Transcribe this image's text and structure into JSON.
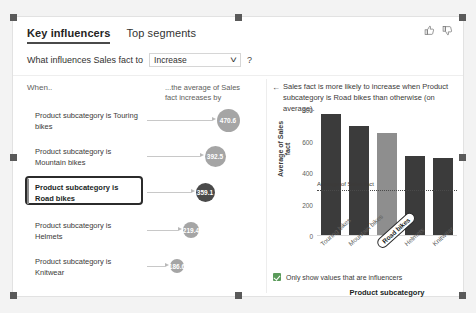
{
  "visual": {
    "tabs": [
      {
        "label": "Key influencers",
        "active": true
      },
      {
        "label": "Top segments",
        "active": false
      }
    ],
    "question": {
      "label": "What influences Sales fact to",
      "dropdown_value": "Increase",
      "help": "?"
    },
    "feedback": {
      "like_icon": "thumbs-up-icon",
      "dislike_icon": "thumbs-down-icon"
    }
  },
  "left_panel": {
    "col_when": "When..",
    "col_average": "...the average of Sales fact increases by",
    "influencers": [
      {
        "text": "Product subcategory is Touring bikes",
        "value": "470.6",
        "selected": false
      },
      {
        "text": "Product subcategory is Mountain bikes",
        "value": "392.5",
        "selected": false
      },
      {
        "text": "Product subcategory is Road bikes",
        "value": "359.1",
        "selected": true
      },
      {
        "text": "Product subcategory is Helmets",
        "value": "219.4",
        "selected": false
      },
      {
        "text": "Product subcategory is Knitwear",
        "value": "186.6",
        "selected": false
      }
    ]
  },
  "right_panel": {
    "back_icon": "back-arrow-icon",
    "description": "Sales fact is more likely to increase when Product subcategory is Road bikes than otherwise (on average).",
    "checkbox": {
      "label": "Only show values that are influencers",
      "checked": true
    }
  },
  "chart_data": {
    "type": "bar",
    "title": "",
    "categories": [
      "Touring bikes",
      "Mountain bikes",
      "Road bikes",
      "Helmets",
      "Knitwear"
    ],
    "values": [
      770,
      690,
      650,
      500,
      490
    ],
    "highlight_index": 2,
    "xlabel": "Product subcategory",
    "ylabel": "Average of Sales fact",
    "ylim": [
      0,
      800
    ],
    "yticks": [
      0,
      200,
      400,
      600,
      800
    ],
    "ytick_labels": [
      "0",
      "200",
      "400",
      "600",
      "800"
    ],
    "average_line": {
      "value": 290,
      "label": "Average of Sales fact"
    },
    "grid": false,
    "legend": "none",
    "colors": {
      "bar": "#3b3b3b",
      "highlight": "#8e8e8e",
      "bubble": "#a5a5a5",
      "bubble_selected": "#4a4a4a"
    }
  }
}
